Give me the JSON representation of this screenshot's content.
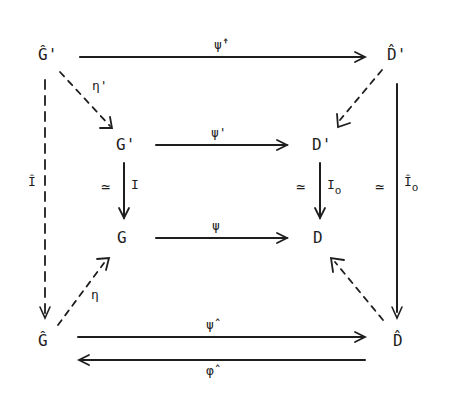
{
  "diagram": {
    "type": "commutative diagram",
    "nodes": {
      "G_hat_prime": "Ĝ'",
      "D_hat_prime": "D̂'",
      "G_prime": "G'",
      "D_prime": "D'",
      "G": "G",
      "D": "D",
      "G_hat": "Ĝ",
      "D_hat": "D̂"
    },
    "arrows": {
      "top": {
        "from": "Ĝ'",
        "to": "D̂'",
        "label": "ψ̂'",
        "style": "solid"
      },
      "eta_prime": {
        "from": "Ĝ'",
        "to": "G'",
        "label": "η'",
        "style": "dashed"
      },
      "D_hat_prime_to_D_prime": {
        "from": "D̂'",
        "to": "D'",
        "label": "",
        "style": "dashed"
      },
      "psi_prime": {
        "from": "G'",
        "to": "D'",
        "label": "ψ'",
        "style": "solid"
      },
      "psi": {
        "from": "G",
        "to": "D",
        "label": "ψ",
        "style": "solid"
      },
      "I": {
        "from": "G'",
        "to": "G",
        "label": "I",
        "iso": "≃",
        "style": "solid"
      },
      "I_o": {
        "from": "D'",
        "to": "D",
        "label": "I",
        "label_sub": "o",
        "iso": "≃",
        "style": "solid"
      },
      "I_hat": {
        "from": "Ĝ'",
        "to": "Ĝ",
        "label": "Î",
        "style": "dashed"
      },
      "I_hat_o": {
        "from": "D̂'",
        "to": "D̂",
        "label": "Î",
        "label_sub": "o",
        "iso": "≃",
        "style": "solid"
      },
      "eta": {
        "from": "Ĝ",
        "to": "G",
        "label": "η",
        "style": "dashed"
      },
      "D_hat_to_D": {
        "from": "D̂",
        "to": "D",
        "label": "",
        "style": "dashed"
      },
      "psi_hat": {
        "from": "Ĝ",
        "to": "D̂",
        "label": "ψ̂",
        "style": "solid"
      },
      "phi_hat": {
        "from": "D̂",
        "to": "Ĝ",
        "label": "φ̂",
        "style": "solid"
      }
    },
    "iso_symbol": "≃"
  }
}
